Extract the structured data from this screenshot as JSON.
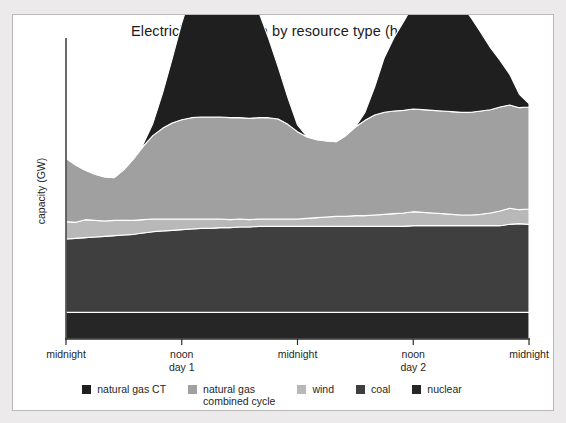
{
  "chart_data": {
    "type": "area",
    "stacked": true,
    "title": "Electricity generation by resource type (hourly)",
    "xlabel": "",
    "ylabel": "capacity (GW)",
    "grid": false,
    "legend_position": "bottom",
    "x_tick_labels": [
      {
        "main": "midnight",
        "sub": ""
      },
      {
        "main": "noon",
        "sub": "day 1"
      },
      {
        "main": "midnight",
        "sub": ""
      },
      {
        "main": "noon",
        "sub": "day 2"
      },
      {
        "main": "midnight",
        "sub": ""
      }
    ],
    "x": [
      0,
      1,
      2,
      3,
      4,
      5,
      6,
      7,
      8,
      9,
      10,
      11,
      12,
      13,
      14,
      15,
      16,
      17,
      18,
      19,
      20,
      21,
      22,
      23,
      24,
      25,
      26,
      27,
      28,
      29,
      30,
      31,
      32,
      33,
      34,
      35,
      36,
      37,
      38,
      39,
      40,
      41,
      42,
      43,
      44,
      45,
      46,
      47,
      48
    ],
    "xlim": [
      0,
      48
    ],
    "ylim": [
      0,
      45
    ],
    "series": [
      {
        "name": "nuclear",
        "color": "#262626",
        "values": [
          4.0,
          4.0,
          4.0,
          4.0,
          4.0,
          4.0,
          4.0,
          4.0,
          4.0,
          4.0,
          4.0,
          4.0,
          4.0,
          4.0,
          4.0,
          4.0,
          4.0,
          4.0,
          4.0,
          4.0,
          4.0,
          4.0,
          4.0,
          4.0,
          4.0,
          4.0,
          4.0,
          4.0,
          4.0,
          4.0,
          4.0,
          4.0,
          4.0,
          4.0,
          4.0,
          4.0,
          4.0,
          4.0,
          4.0,
          4.0,
          4.0,
          4.0,
          4.0,
          4.0,
          4.0,
          4.0,
          4.0,
          4.0,
          4.0
        ]
      },
      {
        "name": "coal",
        "color": "#3f3f3f",
        "values": [
          11.0,
          11.1,
          11.2,
          11.3,
          11.4,
          11.5,
          11.6,
          11.7,
          11.9,
          12.1,
          12.2,
          12.3,
          12.4,
          12.5,
          12.6,
          12.6,
          12.7,
          12.7,
          12.8,
          12.8,
          12.9,
          12.9,
          12.9,
          12.9,
          12.9,
          12.9,
          12.9,
          12.9,
          12.9,
          12.9,
          12.9,
          12.9,
          12.9,
          12.9,
          12.9,
          12.9,
          13.0,
          13.0,
          13.0,
          13.0,
          13.0,
          13.0,
          13.0,
          13.0,
          13.0,
          13.0,
          13.2,
          13.3,
          13.2
        ]
      },
      {
        "name": "wind",
        "color": "#b8b8b8",
        "values": [
          2.6,
          2.4,
          2.7,
          2.5,
          2.3,
          2.3,
          2.2,
          2.1,
          2.0,
          1.9,
          1.8,
          1.7,
          1.6,
          1.5,
          1.4,
          1.4,
          1.3,
          1.2,
          1.2,
          1.1,
          1.1,
          1.1,
          1.1,
          1.1,
          1.1,
          1.2,
          1.3,
          1.4,
          1.5,
          1.5,
          1.6,
          1.6,
          1.7,
          1.8,
          1.9,
          2.0,
          2.1,
          2.0,
          1.9,
          1.8,
          1.7,
          1.6,
          1.6,
          1.7,
          1.9,
          2.2,
          2.4,
          2.1,
          2.3
        ]
      },
      {
        "name": "natural gas combined cycle",
        "color": "#a0a0a0",
        "values": [
          9.5,
          8.6,
          7.4,
          6.9,
          6.6,
          6.4,
          7.6,
          9.2,
          11.0,
          12.5,
          13.6,
          14.4,
          14.9,
          15.2,
          15.3,
          15.3,
          15.3,
          15.3,
          15.2,
          15.2,
          15.2,
          15.2,
          15.0,
          14.2,
          13.1,
          12.2,
          11.7,
          11.4,
          11.2,
          12.1,
          13.3,
          14.3,
          15.0,
          15.3,
          15.4,
          15.4,
          15.4,
          15.4,
          15.4,
          15.4,
          15.4,
          15.4,
          15.4,
          15.5,
          15.5,
          15.6,
          15.5,
          15.3,
          15.3
        ]
      },
      {
        "name": "natural gas CT",
        "color": "#1f1f1f",
        "values": [
          0,
          0,
          0,
          0,
          0,
          0,
          0,
          0,
          0.3,
          1.8,
          5.2,
          9.6,
          14.5,
          18.6,
          21.5,
          23.1,
          23.6,
          23.2,
          21.7,
          19.2,
          15.8,
          11.9,
          7.8,
          4.0,
          1.0,
          0,
          0,
          0,
          0,
          0,
          0,
          1.2,
          4.2,
          8.2,
          11.0,
          13.3,
          15.6,
          17.2,
          16.9,
          18.0,
          17.4,
          16.0,
          14.2,
          11.8,
          9.3,
          7.0,
          4.6,
          2.0,
          0.5
        ]
      }
    ]
  },
  "legend": {
    "items": [
      {
        "label": "natural gas CT",
        "color": "#1f1f1f"
      },
      {
        "label": "natural gas\ncombined cycle",
        "color": "#a0a0a0"
      },
      {
        "label": "wind",
        "color": "#b8b8b8"
      },
      {
        "label": "coal",
        "color": "#3f3f3f"
      },
      {
        "label": "nuclear",
        "color": "#262626"
      }
    ]
  },
  "axis": {
    "line_color": "#2b2b2b"
  }
}
